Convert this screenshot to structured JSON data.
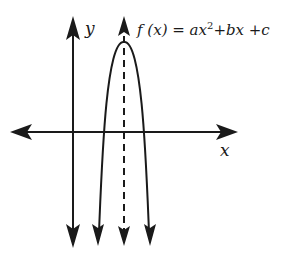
{
  "diagram": {
    "equation": {
      "lhs": "f (x) = ax",
      "exponent": "2",
      "rhs": "+bx +c"
    },
    "axes": {
      "x_label": "x",
      "y_label": "y"
    },
    "elements": [
      "x-axis with arrows both directions",
      "y-axis with arrows both directions",
      "parabola opening downward with arrowheads at both ends",
      "dashed vertical axis of symmetry through vertex with arrows"
    ],
    "colors": {
      "ink": "#1a1a1a",
      "background": "#ffffff"
    }
  }
}
